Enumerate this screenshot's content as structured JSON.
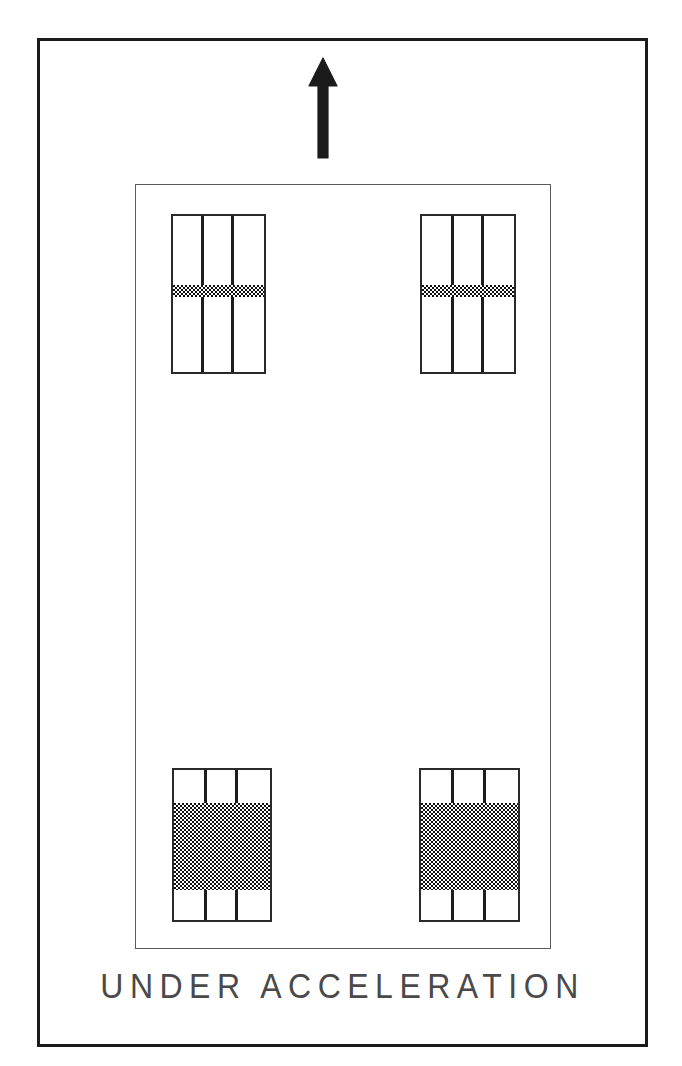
{
  "diagram": {
    "caption": "UNDER ACCELERATION",
    "arrow": {
      "name": "direction-of-travel-arrow",
      "direction": "up",
      "meaning": "direction of vehicle travel / acceleration"
    },
    "colors": {
      "frame_stroke": "#1b1b1b",
      "chassis_stroke": "#5c5c5c",
      "tire_stroke": "#2a2a2a",
      "rib_stroke": "#1d1d1d",
      "contact_patch_fill": "#101010",
      "caption_color": "#4a4a4a",
      "background": "#ffffff"
    },
    "chassis": {
      "label": "vehicle chassis outline"
    },
    "tires": [
      {
        "position": "front-left",
        "label": "front left tire footprint",
        "rib_count": 2,
        "contact_patch": {
          "top_pct": 44,
          "height_pct": 8,
          "load": "light"
        }
      },
      {
        "position": "front-right",
        "label": "front right tire footprint",
        "rib_count": 2,
        "contact_patch": {
          "top_pct": 44,
          "height_pct": 8,
          "load": "light"
        }
      },
      {
        "position": "rear-left",
        "label": "rear left tire footprint",
        "rib_count": 2,
        "contact_patch": {
          "top_pct": 22,
          "height_pct": 58,
          "load": "heavy"
        }
      },
      {
        "position": "rear-right",
        "label": "rear right tire footprint",
        "rib_count": 2,
        "contact_patch": {
          "top_pct": 22,
          "height_pct": 58,
          "load": "heavy"
        }
      }
    ]
  }
}
